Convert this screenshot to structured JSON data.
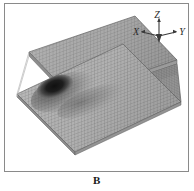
{
  "figure": {
    "caption": "B",
    "panel_border_color": "#8a8a8a",
    "background_color": "#ffffff"
  },
  "axis_triad": {
    "name": "coordinate-axis-indicator",
    "axes": [
      {
        "id": "x",
        "label": "X",
        "direction": "left-down"
      },
      {
        "id": "y",
        "label": "Y",
        "direction": "right-down"
      },
      {
        "id": "z",
        "label": "Z",
        "direction": "up"
      }
    ],
    "arrow_color": "#3a3a3a",
    "label_color": "#2b2b2b"
  },
  "model": {
    "name": "channel-section-finite-element-mesh",
    "description": "Isometric grayscale finite-element mesh of a channel (C) section beam: an upper flange plate, a lower flange plate and a connecting vertical web.",
    "parts": [
      {
        "id": "upper-flange",
        "label": "Upper flange plate",
        "shade": "#a8a8a8"
      },
      {
        "id": "web",
        "label": "Vertical web",
        "shade": "#8f8f8f"
      },
      {
        "id": "lower-flange",
        "label": "Lower flange plate",
        "shade": "#b2b2b2"
      },
      {
        "id": "web-inner",
        "label": "Web inner face",
        "shade": "#9a9a9a"
      }
    ],
    "mesh": {
      "visible": true,
      "style": "fine quadrilateral grid",
      "line_color": "#6f6f6f"
    },
    "contour": {
      "id": "stress-hotspot",
      "label": "Dark contour region on lower flange",
      "peak_color": "#151515",
      "mid_color": "#4a4a4a",
      "fade_color": "#9c9c9c",
      "location": "upper-left quadrant of lower flange"
    }
  }
}
